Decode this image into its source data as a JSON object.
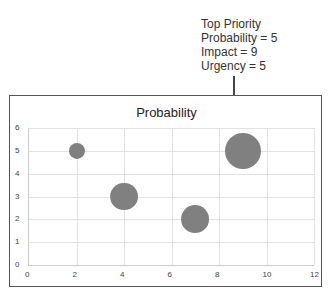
{
  "annotation": {
    "lines": [
      "Top Priority",
      "Probability = 5",
      "Impact = 9",
      "Urgency = 5"
    ]
  },
  "chart_data": {
    "type": "scatter",
    "subtype": "bubble",
    "title": "Probability",
    "xlabel": "",
    "ylabel": "",
    "xlim": [
      0,
      12
    ],
    "ylim": [
      0,
      6
    ],
    "x_ticks": [
      "0",
      "2",
      "4",
      "6",
      "8",
      "10",
      "12"
    ],
    "y_ticks": [
      "0",
      "1",
      "2",
      "3",
      "4",
      "5",
      "6"
    ],
    "grid": true,
    "legend": "none",
    "series": [
      {
        "name": "Probability",
        "points": [
          {
            "x": 2,
            "y": 5,
            "size": 1
          },
          {
            "x": 4,
            "y": 3,
            "size": 3
          },
          {
            "x": 7,
            "y": 2,
            "size": 3
          },
          {
            "x": 9,
            "y": 5,
            "size": 5
          }
        ],
        "color": "#808080"
      }
    ],
    "annotations": [
      {
        "text": "Top Priority\nProbability = 5\nImpact = 9\nUrgency = 5",
        "points_to": {
          "x": 9,
          "y": 5
        }
      }
    ]
  }
}
